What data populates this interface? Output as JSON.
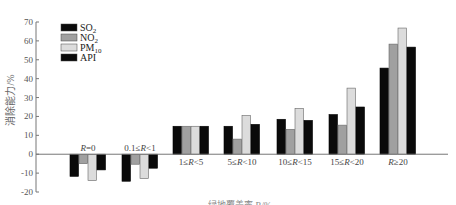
{
  "chart_data": {
    "type": "bar",
    "title": "",
    "xlabel": "绿地覆盖率 R/%",
    "ylabel": "消除能力/%",
    "ylim": [
      -20,
      70
    ],
    "yticks": [
      70,
      60,
      50,
      40,
      30,
      20,
      10,
      0,
      -10,
      -20
    ],
    "grid": false,
    "legend_position": "upper-left",
    "categories": [
      "R=0",
      "0.1≤R<1",
      "1≤R<5",
      "5≤R<10",
      "10≤R<15",
      "15≤R<20",
      "R≥20"
    ],
    "series": [
      {
        "name": "SO2",
        "label_main": "SO",
        "label_sub": "2",
        "color": "#0a0a0a",
        "values": [
          -11.7,
          -14.3,
          14.8,
          14.8,
          18.5,
          21.0,
          45.6
        ]
      },
      {
        "name": "NO2",
        "label_main": "NO",
        "label_sub": "2",
        "color": "#a0a0a0",
        "values": [
          -5.0,
          -5.3,
          14.8,
          8.0,
          13.2,
          15.4,
          58.3
        ]
      },
      {
        "name": "PM10",
        "label_main": "PM",
        "label_sub": "10",
        "color": "#dcdcdc",
        "values": [
          -14.0,
          -12.9,
          14.8,
          20.5,
          24.3,
          35.0,
          66.8
        ]
      },
      {
        "name": "API",
        "label_main": "API",
        "label_sub": "",
        "color": "#0a0a0a",
        "values": [
          -8.3,
          -7.4,
          14.8,
          15.8,
          17.9,
          25.0,
          56.7
        ]
      }
    ]
  }
}
